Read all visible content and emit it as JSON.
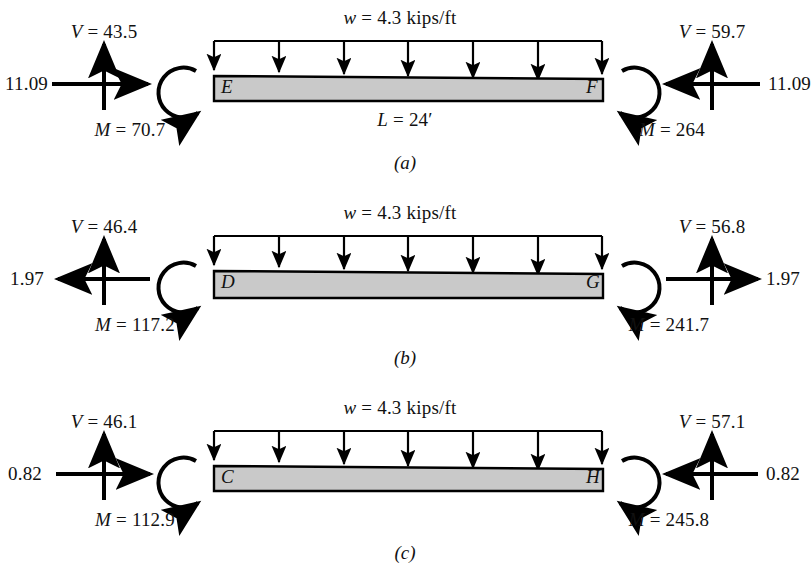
{
  "figure": {
    "type": "free-body-diagram-set",
    "beam_fill_color": "#c9c9c9",
    "stroke_color": "#000000",
    "panels": [
      {
        "caption": "(a)",
        "load_label": "w = 4.3 kips/ft",
        "span_label": "L = 24′",
        "left": {
          "node": "E",
          "shear_label": "V = 43.5",
          "axial_label": "11.09",
          "moment_label": "M = 70.7",
          "axial_direction": "right",
          "shear_direction": "up",
          "moment_direction": "clockwise"
        },
        "right": {
          "node": "F",
          "shear_label": "V = 59.7",
          "axial_label": "11.09",
          "moment_label": "M = 264",
          "axial_direction": "left",
          "shear_direction": "up",
          "moment_direction": "counterclockwise"
        }
      },
      {
        "caption": "(b)",
        "load_label": "w = 4.3 kips/ft",
        "span_label": "",
        "left": {
          "node": "D",
          "shear_label": "V = 46.4",
          "axial_label": "1.97",
          "moment_label": "M = 117.2",
          "axial_direction": "left",
          "shear_direction": "up",
          "moment_direction": "clockwise"
        },
        "right": {
          "node": "G",
          "shear_label": "V = 56.8",
          "axial_label": "1.97",
          "moment_label": "M = 241.7",
          "axial_direction": "right",
          "shear_direction": "up",
          "moment_direction": "counterclockwise"
        }
      },
      {
        "caption": "(c)",
        "load_label": "w = 4.3 kips/ft",
        "span_label": "",
        "left": {
          "node": "C",
          "shear_label": "V = 46.1",
          "axial_label": "0.82",
          "moment_label": "M = 112.9",
          "axial_direction": "right",
          "shear_direction": "up",
          "moment_direction": "clockwise"
        },
        "right": {
          "node": "H",
          "shear_label": "V = 57.1",
          "axial_label": "0.82",
          "moment_label": "M = 245.8",
          "axial_direction": "left",
          "shear_direction": "up",
          "moment_direction": "counterclockwise"
        }
      }
    ]
  }
}
